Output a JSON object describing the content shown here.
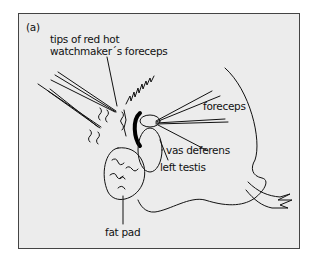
{
  "figure": {
    "panel_label": "(a)",
    "labels": {
      "tips": [
        "tips of red hot",
        "watchmaker´s foreceps"
      ],
      "forceps": "foreceps",
      "vas_deferens": "vas deferens",
      "left_testis": "left testis",
      "fat_pad": "fat pad"
    },
    "colors": {
      "background": "#ececec",
      "line": "#111111",
      "frame": "#444444"
    }
  }
}
